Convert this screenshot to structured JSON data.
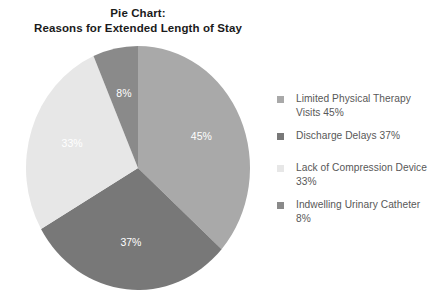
{
  "chart_data": {
    "type": "pie",
    "title": "Pie Chart:\nReasons for Extended Length of Stay",
    "title_line1": "Pie Chart:",
    "title_line2": "Reasons for Extended Length of Stay",
    "categories": [
      "Limited Physical Therapy Visits",
      "Discharge Delays",
      "Lack of Compression Device",
      "Indwelling Urinary Catheter"
    ],
    "values": [
      45,
      37,
      33,
      8
    ],
    "value_labels": [
      "45%",
      "37%",
      "33%",
      "8%"
    ],
    "legend_labels": [
      "Limited Physical Therapy Visits 45%",
      "Discharge Delays 37%",
      "Lack of Compression Device 33%",
      "Indwelling Urinary Catheter 8%"
    ],
    "colors": [
      "#a9a9a9",
      "#787878",
      "#e7e7e7",
      "#8a8a8a"
    ],
    "slice_label_color": "#ffffff",
    "legend_text_color": "#585858",
    "legend_position": "right",
    "start_angle_deg": 0,
    "direction": "clockwise",
    "grid": false,
    "background": "#ffffff",
    "total": 123,
    "slices": [
      {
        "label": "Limited Physical Therapy Visits",
        "value": 45,
        "display": "45%",
        "color": "#a9a9a9",
        "legend": "Limited Physical Therapy Visits 45%"
      },
      {
        "label": "Discharge Delays",
        "value": 37,
        "display": "37%",
        "color": "#787878",
        "legend": "Discharge Delays 37%"
      },
      {
        "label": "Lack of Compression Device",
        "value": 33,
        "display": "33%",
        "color": "#e7e7e7",
        "legend": "Lack of Compression Device 33%"
      },
      {
        "label": "Indwelling Urinary Catheter",
        "value": 8,
        "display": "8%",
        "color": "#8a8a8a",
        "legend": "Indwelling Urinary Catheter 8%"
      }
    ]
  }
}
